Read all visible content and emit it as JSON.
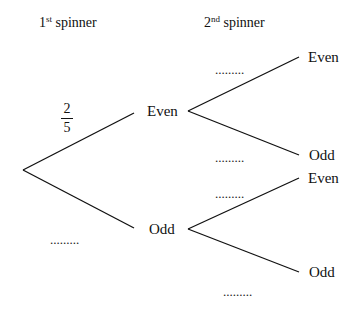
{
  "headers": {
    "first": {
      "num": "1",
      "sup": "st",
      "text": " spinner"
    },
    "second": {
      "num": "2",
      "sup": "nd",
      "text": " spinner"
    }
  },
  "first_level": {
    "even": {
      "label": "Even",
      "probability": {
        "numerator": "2",
        "denominator": "5"
      }
    },
    "odd": {
      "label": "Odd",
      "probability": "........."
    }
  },
  "second_level": {
    "after_even": {
      "even": {
        "label": "Even",
        "probability": "........."
      },
      "odd": {
        "label": "Odd",
        "probability": "........."
      }
    },
    "after_odd": {
      "even": {
        "label": "Even",
        "probability": "........."
      },
      "odd": {
        "label": "Odd",
        "probability": "........."
      }
    }
  },
  "line_color": "#111111"
}
